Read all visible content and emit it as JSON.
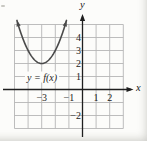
{
  "figure": {
    "curve_label": "y = f(x)",
    "x_axis_label": "x",
    "y_axis_label": "y"
  },
  "colors": {
    "background": "#fcfcfa",
    "grid": "#b5b5b5",
    "axis": "#1f1f1f",
    "curve": "#4a4a4a",
    "text": "#1c1c1c"
  },
  "chart_data": {
    "type": "line",
    "title": "",
    "curve_label": "y = f(x)",
    "function": "f(x) = (x + 3)^2 + 2",
    "vertex": [
      -3,
      2
    ],
    "coefficient_a": 1,
    "x_drawn_range": [
      -4.82,
      -1.18
    ],
    "points": [
      [
        -4.82,
        5.3
      ],
      [
        -4,
        3
      ],
      [
        -3.5,
        2.25
      ],
      [
        -3,
        2
      ],
      [
        -2.5,
        2.25
      ],
      [
        -2,
        3
      ],
      [
        -1.18,
        5.3
      ]
    ],
    "xlim": [
      -5,
      3
    ],
    "ylim": [
      -3,
      5
    ],
    "x_ticks": [
      -3,
      -1,
      1,
      2
    ],
    "x_tick_labels": [
      "−3",
      "−1",
      "1",
      "2"
    ],
    "y_ticks": [
      4,
      3,
      2,
      1,
      -2
    ],
    "y_tick_labels": [
      "4",
      "3",
      "2",
      "1",
      "−2"
    ],
    "xlabel": "x",
    "ylabel": "y",
    "grid": true
  }
}
